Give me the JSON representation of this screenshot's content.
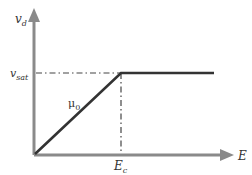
{
  "diagram": {
    "y_axis_label": "v",
    "y_axis_sub": "d",
    "x_axis_label": "E",
    "sat_label": "v",
    "sat_sub": "sat",
    "critical_label": "E",
    "critical_sub": "c",
    "slope_label": "μ",
    "slope_sub": "0",
    "colors": {
      "axis": "#8a8a8a",
      "curve": "#333333",
      "dash": "#444444",
      "text": "#333333"
    }
  }
}
